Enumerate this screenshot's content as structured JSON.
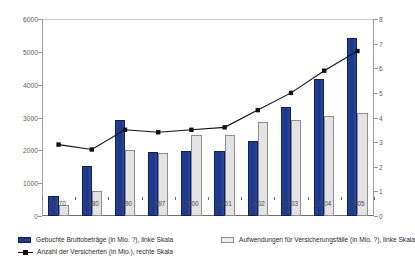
{
  "chart_data": {
    "type": "bar",
    "title": "",
    "subtitle": "",
    "xlabel": "",
    "ylabel": "",
    "y2label": "",
    "grid": false,
    "legend_position": "bottom",
    "categories": [
      "1970",
      "1980",
      "1990",
      "1997",
      "2000",
      "2001",
      "2002",
      "2003",
      "2004",
      "2005"
    ],
    "ylim": [
      0,
      6000
    ],
    "yticks": [
      0,
      1000,
      2000,
      3000,
      4000,
      5000,
      6000
    ],
    "y2lim": [
      0,
      8
    ],
    "y2ticks": [
      0,
      1,
      2,
      3,
      4,
      5,
      6,
      7,
      8
    ],
    "series": [
      {
        "name": "Gebuchte Bruttobeträge (in Mio. ?), linke Skala",
        "type": "bar",
        "axis": "left",
        "color": "#1f3a93",
        "values": [
          620,
          1520,
          2920,
          1960,
          1980,
          1980,
          2280,
          3320,
          4180,
          5430
        ]
      },
      {
        "name": "Aufwendungen für Versicherungsfälle (in Mio. ?), linke Skala",
        "type": "bar",
        "axis": "left",
        "color": "#e3e3e3",
        "values": [
          330,
          760,
          2020,
          1920,
          2460,
          2460,
          2870,
          2920,
          3040,
          3130
        ]
      },
      {
        "name": "Anzahl der Versicherten (in Mio.), rechte Skala",
        "type": "line",
        "axis": "right",
        "color": "#111111",
        "marker": "square",
        "values": [
          2.9,
          2.7,
          3.5,
          3.4,
          3.5,
          3.6,
          4.3,
          5.0,
          5.9,
          6.7
        ]
      }
    ]
  },
  "axis": {
    "left_ticks": [
      "0",
      "1000",
      "2000",
      "3000",
      "4000",
      "5000",
      "6000"
    ],
    "right_ticks": [
      "0",
      "1",
      "2",
      "3",
      "4",
      "5",
      "6",
      "7",
      "8"
    ]
  },
  "legend": {
    "item1": "Gebuchte Bruttobeträge (in Mio. ?), linke Skala",
    "item2": "Aufwendungen für Versicherungsfälle (in Mio. ?), linke Skala",
    "item3": "Anzahl der Versicherten (in Mio.), rechte Skala"
  }
}
